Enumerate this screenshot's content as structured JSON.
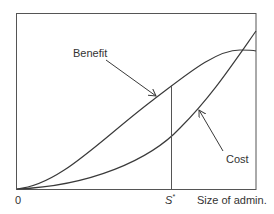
{
  "figure": {
    "type": "cost-benefit diagram",
    "curves": [
      {
        "name": "Benefit",
        "label": "Benefit",
        "shape": "S-curve rising then flattening"
      },
      {
        "name": "Cost",
        "label": "Cost",
        "shape": "convex rising"
      }
    ],
    "x_axis": {
      "origin_label": "0",
      "label": "Size of admin.",
      "marker": {
        "symbol": "S",
        "superscript": "*"
      }
    },
    "colors": {
      "line": "#3a3a3a",
      "text": "#333333",
      "background": "#ffffff"
    }
  }
}
